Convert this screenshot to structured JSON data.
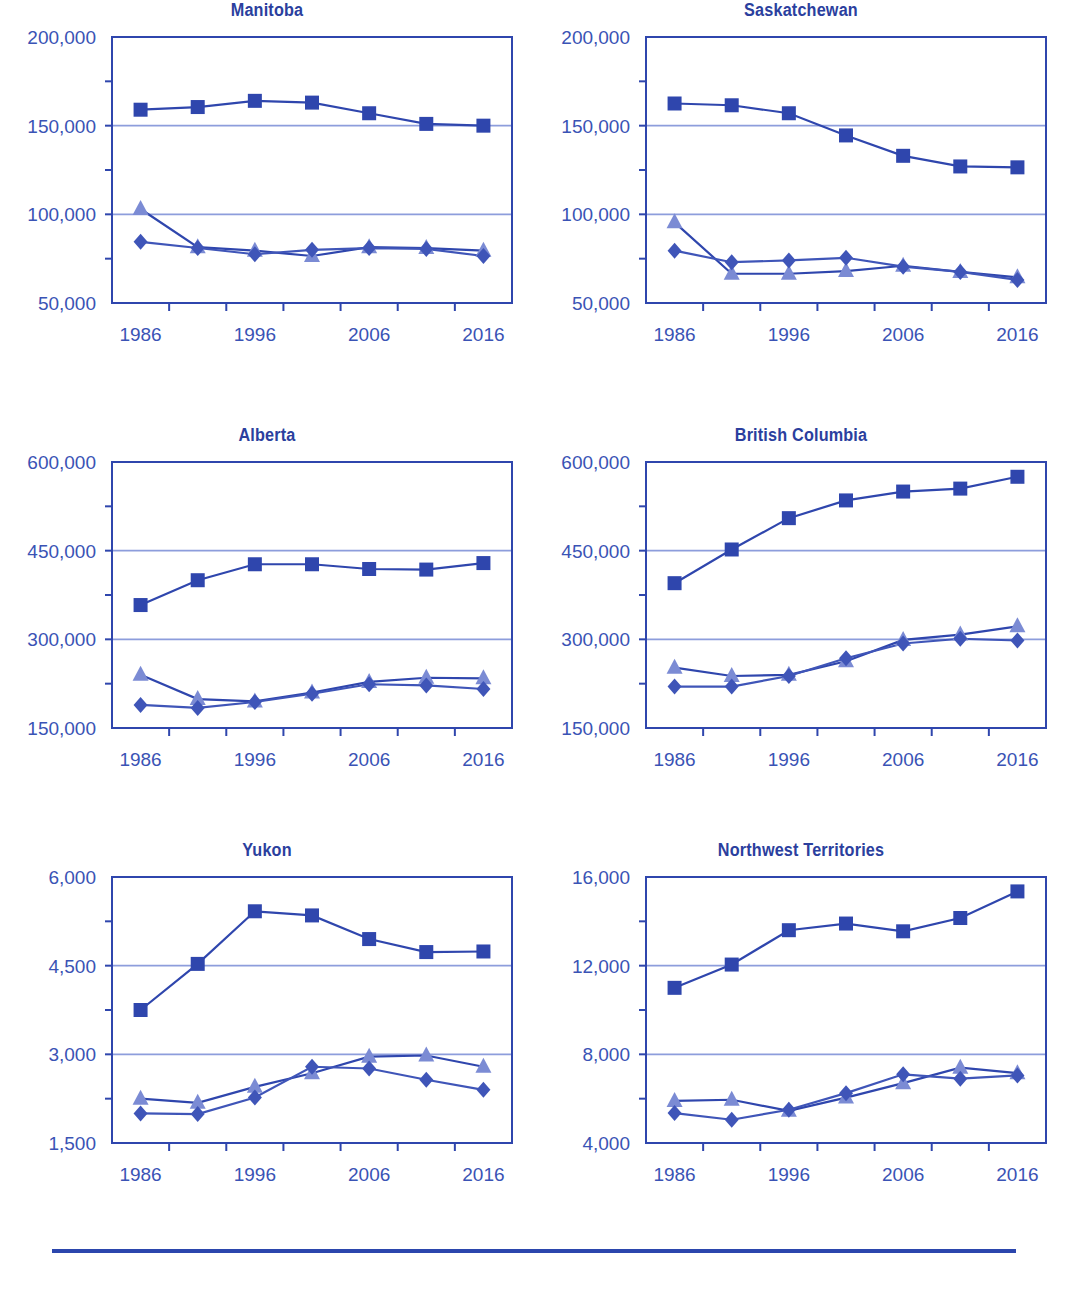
{
  "figure": {
    "footer_rule": true,
    "colors": {
      "series_square": "#2f46ad",
      "series_diamond": "#3f55b8",
      "series_triangle": "#7b8bd4",
      "axis": "#2f46ad",
      "gridline": "#8d9ddc",
      "text": "#3a53b5",
      "title": "#2b3f9e",
      "background": "#ffffff"
    }
  },
  "chart_data": [
    {
      "type": "line",
      "title": "Manitoba",
      "xlabel": "",
      "ylabel": "",
      "x": [
        1986,
        1991,
        1996,
        2001,
        2006,
        2011,
        2016
      ],
      "xticklabels": [
        "1986",
        "",
        "1996",
        "",
        "2006",
        "",
        "2016"
      ],
      "xlim": [
        1983.5,
        2018.5
      ],
      "ylim": [
        50000,
        200000
      ],
      "yticks": [
        50000,
        100000,
        150000,
        200000
      ],
      "yticklabels": [
        "50,000",
        "100,000",
        "150,000",
        "200,000"
      ],
      "grid": true,
      "gridlines": [
        100000,
        150000
      ],
      "series": [
        {
          "name": "series-square",
          "marker": "square",
          "values": [
            159000,
            160500,
            164000,
            163000,
            157000,
            151000,
            150000
          ]
        },
        {
          "name": "series-diamond",
          "marker": "diamond",
          "values": [
            84500,
            81000,
            77500,
            80000,
            81000,
            80500,
            76500
          ]
        },
        {
          "name": "series-triangle",
          "marker": "triangle",
          "values": [
            103000,
            81500,
            79500,
            76500,
            81500,
            81000,
            79500
          ]
        }
      ]
    },
    {
      "type": "line",
      "title": "Saskatchewan",
      "xlabel": "",
      "ylabel": "",
      "x": [
        1986,
        1991,
        1996,
        2001,
        2006,
        2011,
        2016
      ],
      "xticklabels": [
        "1986",
        "",
        "1996",
        "",
        "2006",
        "",
        "2016"
      ],
      "xlim": [
        1983.5,
        2018.5
      ],
      "ylim": [
        50000,
        200000
      ],
      "yticks": [
        50000,
        100000,
        150000,
        200000
      ],
      "yticklabels": [
        "50,000",
        "100,000",
        "150,000",
        "200,000"
      ],
      "grid": true,
      "gridlines": [
        100000,
        150000
      ],
      "series": [
        {
          "name": "series-square",
          "marker": "square",
          "values": [
            162500,
            161500,
            157000,
            144500,
            133000,
            127000,
            126500
          ]
        },
        {
          "name": "series-diamond",
          "marker": "diamond",
          "values": [
            79500,
            73000,
            74000,
            75500,
            70500,
            67500,
            63000
          ]
        },
        {
          "name": "series-triangle",
          "marker": "triangle",
          "values": [
            95500,
            66500,
            66500,
            68000,
            71000,
            67500,
            64500
          ]
        }
      ]
    },
    {
      "type": "line",
      "title": "Alberta",
      "xlabel": "",
      "ylabel": "",
      "x": [
        1986,
        1991,
        1996,
        2001,
        2006,
        2011,
        2016
      ],
      "xticklabels": [
        "1986",
        "",
        "1996",
        "",
        "2006",
        "",
        "2016"
      ],
      "xlim": [
        1983.5,
        2018.5
      ],
      "ylim": [
        150000,
        600000
      ],
      "yticks": [
        150000,
        300000,
        450000,
        600000
      ],
      "yticklabels": [
        "150,000",
        "300,000",
        "450,000",
        "600,000"
      ],
      "grid": true,
      "gridlines": [
        300000,
        450000
      ],
      "series": [
        {
          "name": "series-square",
          "marker": "square",
          "values": [
            358000,
            400000,
            427000,
            427000,
            419000,
            418000,
            429000
          ]
        },
        {
          "name": "series-diamond",
          "marker": "diamond",
          "values": [
            189000,
            184000,
            194000,
            208000,
            224000,
            222000,
            216000
          ]
        },
        {
          "name": "series-triangle",
          "marker": "triangle",
          "values": [
            240000,
            199000,
            195000,
            210000,
            228000,
            235000,
            234000
          ]
        }
      ]
    },
    {
      "type": "line",
      "title": "British Columbia",
      "xlabel": "",
      "ylabel": "",
      "x": [
        1986,
        1991,
        1996,
        2001,
        2006,
        2011,
        2016
      ],
      "xticklabels": [
        "1986",
        "",
        "1996",
        "",
        "2006",
        "",
        "2016"
      ],
      "xlim": [
        1983.5,
        2018.5
      ],
      "ylim": [
        150000,
        600000
      ],
      "yticks": [
        150000,
        300000,
        450000,
        600000
      ],
      "yticklabels": [
        "150,000",
        "300,000",
        "450,000",
        "600,000"
      ],
      "grid": true,
      "gridlines": [
        300000,
        450000
      ],
      "series": [
        {
          "name": "series-square",
          "marker": "square",
          "values": [
            395000,
            452000,
            505000,
            535000,
            550000,
            555000,
            575000
          ]
        },
        {
          "name": "series-diamond",
          "marker": "diamond",
          "values": [
            220000,
            220000,
            238000,
            268000,
            293000,
            301000,
            298000
          ]
        },
        {
          "name": "series-triangle",
          "marker": "triangle",
          "values": [
            252000,
            238000,
            240000,
            263000,
            299000,
            308000,
            322000
          ]
        }
      ]
    },
    {
      "type": "line",
      "title": "Yukon",
      "xlabel": "",
      "ylabel": "",
      "x": [
        1986,
        1991,
        1996,
        2001,
        2006,
        2011,
        2016
      ],
      "xticklabels": [
        "1986",
        "",
        "1996",
        "",
        "2006",
        "",
        "2016"
      ],
      "xlim": [
        1983.5,
        2018.5
      ],
      "ylim": [
        1500,
        6000
      ],
      "yticks": [
        1500,
        3000,
        4500,
        6000
      ],
      "yticklabels": [
        "1,500",
        "3,000",
        "4,500",
        "6,000"
      ],
      "grid": true,
      "gridlines": [
        3000,
        4500
      ],
      "series": [
        {
          "name": "series-square",
          "marker": "square",
          "values": [
            3750,
            4530,
            5420,
            5350,
            4950,
            4730,
            4740
          ]
        },
        {
          "name": "series-diamond",
          "marker": "diamond",
          "values": [
            2000,
            1990,
            2270,
            2790,
            2760,
            2570,
            2400
          ]
        },
        {
          "name": "series-triangle",
          "marker": "triangle",
          "values": [
            2250,
            2180,
            2450,
            2680,
            2960,
            2980,
            2790
          ]
        }
      ]
    },
    {
      "type": "line",
      "title": "Northwest Territories",
      "xlabel": "",
      "ylabel": "",
      "x": [
        1986,
        1991,
        1996,
        2001,
        2006,
        2011,
        2016
      ],
      "xticklabels": [
        "1986",
        "",
        "1996",
        "",
        "2006",
        "",
        "2016"
      ],
      "xlim": [
        1983.5,
        2018.5
      ],
      "ylim": [
        4000,
        16000
      ],
      "yticks": [
        4000,
        8000,
        12000,
        16000
      ],
      "yticklabels": [
        "4,000",
        "8,000",
        "12,000",
        "16,000"
      ],
      "grid": true,
      "gridlines": [
        8000,
        12000
      ],
      "series": [
        {
          "name": "series-square",
          "marker": "square",
          "values": [
            11000,
            12050,
            13600,
            13900,
            13550,
            14150,
            15350
          ]
        },
        {
          "name": "series-diamond",
          "marker": "diamond",
          "values": [
            5350,
            5050,
            5500,
            6250,
            7100,
            6900,
            7050
          ]
        },
        {
          "name": "series-triangle",
          "marker": "triangle",
          "values": [
            5900,
            5950,
            5450,
            6050,
            6700,
            7400,
            7150
          ]
        }
      ]
    }
  ]
}
